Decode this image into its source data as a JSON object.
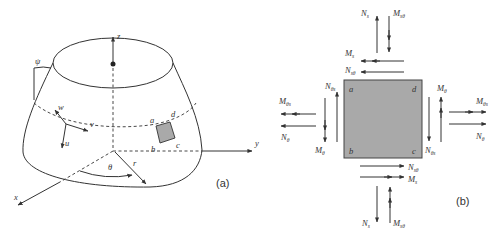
{
  "figure_a": {
    "caption": "(a)",
    "axes": {
      "z": "z",
      "y": "y",
      "x": "x"
    },
    "angles": {
      "psi": "ψ",
      "theta": "θ"
    },
    "radius": "r",
    "displacements": {
      "u": "u",
      "v": "v",
      "w": "w"
    },
    "element_corners": {
      "a": "a",
      "b": "b",
      "c": "c",
      "d": "d"
    },
    "element_fill": "#a9a9a9"
  },
  "figure_b": {
    "caption": "(b)",
    "element_corners": {
      "a": "a",
      "b": "b",
      "c": "c",
      "d": "d"
    },
    "element_fill": "#a9a9a9",
    "labels": {
      "top_n": {
        "main": "N",
        "sub": "s"
      },
      "top_m": {
        "main": "M",
        "sub": "sθ"
      },
      "top_mh": {
        "main": "M",
        "sub": "s"
      },
      "top_nh": {
        "main": "N",
        "sub": "sθ"
      },
      "left_m": {
        "main": "M",
        "sub": "θs"
      },
      "left_n": {
        "main": "N",
        "sub": "θ"
      },
      "left_nv": {
        "main": "N",
        "sub": "θs"
      },
      "left_mv": {
        "main": "M",
        "sub": "θ"
      },
      "right_mv": {
        "main": "M",
        "sub": "θ"
      },
      "right_nv": {
        "main": "N",
        "sub": "θs"
      },
      "right_m": {
        "main": "M",
        "sub": "θs"
      },
      "right_n": {
        "main": "N",
        "sub": "θ"
      },
      "bottom_nh": {
        "main": "N",
        "sub": "sθ"
      },
      "bottom_mh": {
        "main": "M",
        "sub": "s"
      },
      "bottom_n": {
        "main": "N",
        "sub": "s"
      },
      "bottom_m": {
        "main": "M",
        "sub": "sθ"
      }
    }
  }
}
